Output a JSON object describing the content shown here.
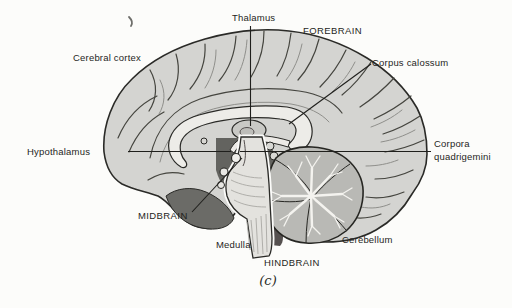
{
  "figure": {
    "caption": "(c)"
  },
  "labels": {
    "thalamus": "Thalamus",
    "forebrain": "FOREBRAIN",
    "cerebral_cortex": "Cerebral cortex",
    "corpus_calossum": "Corpus calossum",
    "hypothalamus": "Hypothalamus",
    "corpora_quadrigemini_line1": "Corpora",
    "corpora_quadrigemini_line2": "quadrigemini",
    "midbrain": "MIDBRAIN",
    "medulla": "Medulla",
    "hindbrain": "HINDBRAIN",
    "cerebellum": "Cerebellum"
  },
  "colors": {
    "paper": "#fcfcfa",
    "ink": "#1f1f1c",
    "cortex_fill": "#d4d4d1",
    "corpus_callosum_fill": "#edece8",
    "cerebellum_fill": "#b9b9b5",
    "brainstem_fill": "#e3e2de",
    "dark_region": "#63635f"
  }
}
